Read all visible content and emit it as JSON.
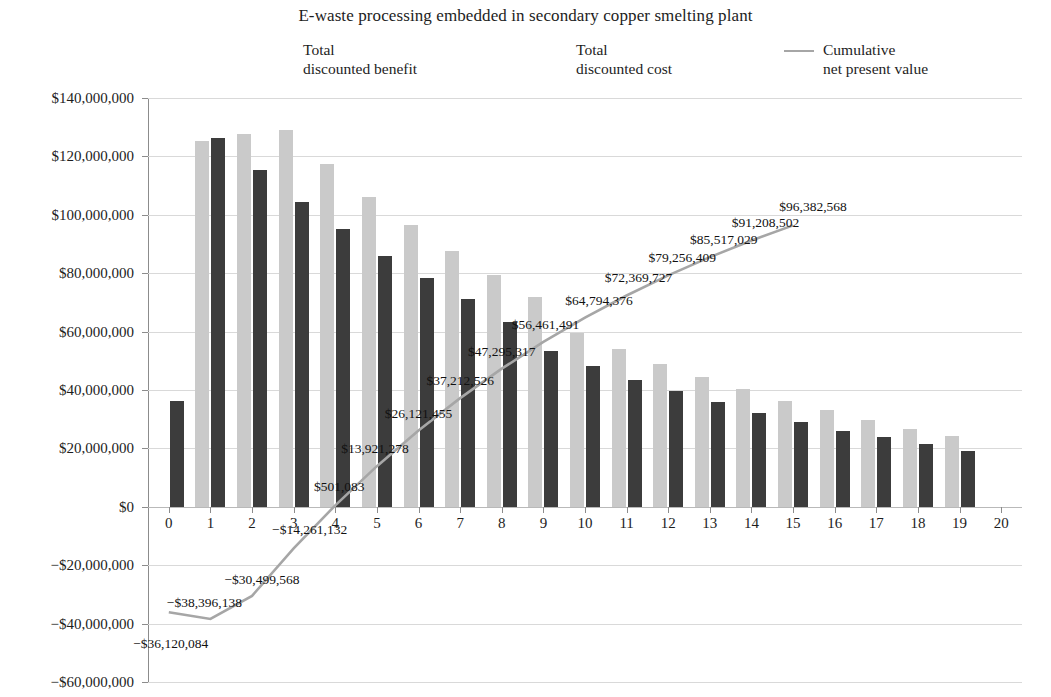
{
  "chart_data": {
    "type": "bar",
    "title": "E-waste processing embedded in secondary copper smelting plant",
    "xlabel": "",
    "ylabel": "",
    "grid": true,
    "legend_position": "top",
    "ylim": [
      -60000000,
      140000000
    ],
    "ytick_labels": [
      "$140,000,000",
      "$120,000,000",
      "$100,000,000",
      "$80,000,000",
      "$60,000,000",
      "$40,000,000",
      "$20,000,000",
      "$0",
      "−$20,000,000",
      "−$40,000,000",
      "−$60,000,000"
    ],
    "ytick_values": [
      140000000,
      120000000,
      100000000,
      80000000,
      60000000,
      40000000,
      20000000,
      0,
      -20000000,
      -40000000,
      -60000000
    ],
    "categories": [
      "0",
      "1",
      "2",
      "3",
      "4",
      "5",
      "6",
      "7",
      "8",
      "9",
      "10",
      "11",
      "12",
      "13",
      "14",
      "15",
      "16",
      "17",
      "18",
      "19",
      "20"
    ],
    "series": [
      {
        "name": "Total discounted benefit",
        "type": "bar",
        "color": "#cacaca",
        "values": [
          0,
          125400000,
          127700000,
          128900000,
          117500000,
          106200000,
          96500000,
          87500000,
          79500000,
          72000000,
          59700000,
          54100000,
          48800000,
          44400000,
          40400000,
          36300000,
          33100000,
          29800000,
          26500000,
          24300000,
          0
        ]
      },
      {
        "name": "Total discounted cost",
        "type": "bar",
        "color": "#3c3c3c",
        "values": [
          36100000,
          126300000,
          115200000,
          104500000,
          95000000,
          86000000,
          78400000,
          71200000,
          63300000,
          53200000,
          48100000,
          43300000,
          39700000,
          36000000,
          32300000,
          29200000,
          26100000,
          23800000,
          21500000,
          19100000,
          0
        ]
      },
      {
        "name": "Cumulative net present value",
        "type": "line",
        "color": "#a6a6a6",
        "x": [
          "0",
          "1",
          "2",
          "3",
          "4",
          "5",
          "6",
          "7",
          "8",
          "9",
          "10",
          "11",
          "12",
          "13",
          "14",
          "15"
        ],
        "values": [
          -36120084,
          -38396138,
          -30499568,
          -14261132,
          501083,
          13921278,
          26121455,
          37212526,
          47295317,
          56461491,
          64794376,
          72369727,
          79256409,
          85517029,
          91208502,
          96382568
        ],
        "point_labels": [
          "−$36,120,084",
          "−$38,396,138",
          "−$30,499,568",
          "−$14,261,132",
          "$501,083",
          "$13,921,278",
          "$26,121,455",
          "$37,212,526",
          "$47,295,317",
          "$56,461,491",
          "$64,794,376",
          "$72,369,727",
          "$79,256,409",
          "$85,517,029",
          "$91,208,502",
          "$96,382,568"
        ]
      }
    ]
  },
  "legend": {
    "items": [
      {
        "label": "Total\ndiscounted benefit",
        "swatch": "benefit",
        "color": "#cacaca"
      },
      {
        "label": "Total\ndiscounted cost",
        "swatch": "cost",
        "color": "#3c3c3c"
      },
      {
        "label": "Cumulative\nnet present value",
        "swatch": "line",
        "color": "#a6a6a6"
      }
    ]
  }
}
